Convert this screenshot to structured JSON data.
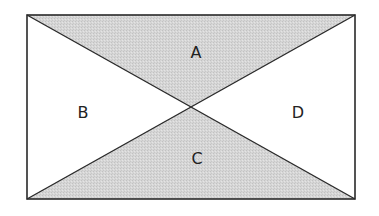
{
  "diagram": {
    "type": "rectangle-with-diagonals",
    "rect": {
      "x": 27,
      "y": 15,
      "width": 328,
      "height": 184
    },
    "colors": {
      "stroke": "#2a2a2a",
      "shaded_fill": "#d2d2d2",
      "unshaded_fill": "#ffffff",
      "label": "#222222"
    },
    "regions": [
      {
        "id": "A",
        "label": "A",
        "position": "top",
        "shaded": true,
        "label_x": 196,
        "label_y": 58
      },
      {
        "id": "B",
        "label": "B",
        "position": "left",
        "shaded": false,
        "label_x": 83,
        "label_y": 118
      },
      {
        "id": "C",
        "label": "C",
        "position": "bottom",
        "shaded": true,
        "label_x": 197,
        "label_y": 164
      },
      {
        "id": "D",
        "label": "D",
        "position": "right",
        "shaded": false,
        "label_x": 298,
        "label_y": 118
      }
    ]
  }
}
